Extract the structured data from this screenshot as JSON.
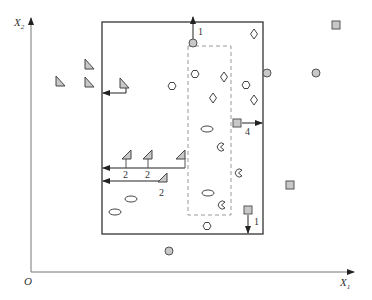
{
  "diagram": {
    "axes": {
      "origin_label": "O",
      "x_label": "X",
      "x_sub": "1",
      "y_label": "X",
      "y_sub": "2"
    },
    "colors": {
      "line": "#333333",
      "axis": "#666666",
      "dashed": "#999999",
      "fill_gray": "#c8c8c8",
      "fill_white": "#ffffff"
    },
    "outer_box": {
      "x": 102,
      "y": 22,
      "w": 161,
      "h": 212
    },
    "inner_dashed_box": {
      "x": 188,
      "y": 46,
      "w": 43,
      "h": 169
    },
    "labels": {
      "top_arrow": "1",
      "right_arrow": "4",
      "bottom_arrow": "1",
      "left_arrow_a": "2",
      "row_arrow_1": "2",
      "row_arrow_2": "2",
      "row_arrow_3": "2"
    },
    "shapes": {
      "gray_circles": [
        [
          193,
          43
        ],
        [
          267,
          73
        ],
        [
          316,
          73
        ],
        [
          169,
          251
        ]
      ],
      "hexagons": [
        [
          172,
          86
        ],
        [
          195,
          74
        ],
        [
          246,
          85
        ],
        [
          207,
          226
        ]
      ],
      "diamonds": [
        [
          254,
          34
        ],
        [
          224,
          77
        ],
        [
          213,
          98
        ],
        [
          254,
          100
        ]
      ],
      "gray_squares": [
        [
          336,
          25
        ],
        [
          237,
          123
        ],
        [
          290,
          185
        ],
        [
          248,
          210
        ]
      ],
      "ellipses": [
        [
          207,
          129
        ],
        [
          208,
          193
        ],
        [
          130,
          199
        ],
        [
          115,
          212
        ]
      ],
      "pacmans": [
        [
          221,
          147
        ],
        [
          239,
          173
        ],
        [
          222,
          205
        ]
      ],
      "left_triangles": [
        [
          60,
          81
        ],
        [
          89,
          64
        ],
        [
          89,
          82
        ],
        [
          124,
          83
        ]
      ],
      "row_triangles": [
        [
          127,
          155
        ],
        [
          148,
          155
        ],
        [
          181,
          155
        ],
        [
          163,
          178
        ]
      ]
    }
  }
}
